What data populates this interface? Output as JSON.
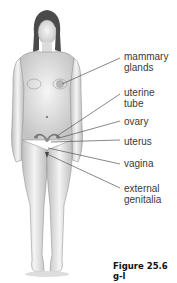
{
  "diagram": {
    "labels": [
      {
        "id": "mammary-glands",
        "text": "mammary\nglands"
      },
      {
        "id": "uterine-tube",
        "text": "uterine\ntube"
      },
      {
        "id": "ovary",
        "text": "ovary"
      },
      {
        "id": "uterus",
        "text": "uterus"
      },
      {
        "id": "vagina",
        "text": "vagina"
      },
      {
        "id": "external-genitalia",
        "text": "external\ngenitalia"
      }
    ],
    "caption": "Figure 25.6 g-l"
  },
  "colors": {
    "skin_light": "#f2f2f2",
    "skin_shade": "#bdbdbd",
    "hair": "#4a4a4a",
    "leader_line": "#555555",
    "organ": "#8a8a8a"
  }
}
